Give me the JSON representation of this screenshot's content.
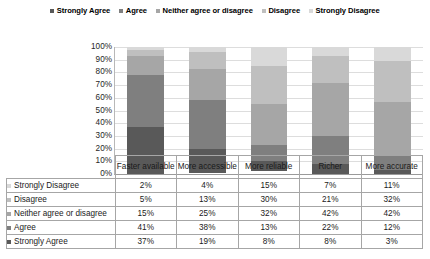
{
  "chart_data": {
    "type": "bar",
    "stacked": true,
    "orientation": "vertical",
    "normalized_percent": true,
    "title": "",
    "xlabel": "",
    "ylabel": "",
    "ylim": [
      0,
      100
    ],
    "grid": true,
    "legend_position": "top-center",
    "categories": [
      "Faster available",
      "More accessible",
      "More reliable",
      "Richer",
      "More accurate"
    ],
    "tick_labels": [
      "100%",
      "90%",
      "80%",
      "70%",
      "60%",
      "50%",
      "40%",
      "30%",
      "20%",
      "10%",
      "0%"
    ],
    "tick_values": [
      100,
      90,
      80,
      70,
      60,
      50,
      40,
      30,
      20,
      10,
      0
    ],
    "stack_order_bottom_to_top": [
      "Strongly Agree",
      "Agree",
      "Neither agree or disagree",
      "Disagree",
      "Strongly Disagree"
    ],
    "series": [
      {
        "name": "Strongly Agree",
        "color": "#595959",
        "values": [
          37,
          19,
          8,
          8,
          3
        ]
      },
      {
        "name": "Agree",
        "color": "#7f7f7f",
        "values": [
          41,
          38,
          13,
          22,
          12
        ]
      },
      {
        "name": "Neither agree or disagree",
        "color": "#a6a6a6",
        "values": [
          15,
          25,
          32,
          42,
          42
        ]
      },
      {
        "name": "Disagree",
        "color": "#bfbfbf",
        "values": [
          5,
          13,
          30,
          21,
          32
        ]
      },
      {
        "name": "Strongly Disagree",
        "color": "#d9d9d9",
        "values": [
          2,
          4,
          15,
          7,
          11
        ]
      }
    ]
  },
  "legend": {
    "items": [
      {
        "label": "Strongly Agree",
        "color": "#595959"
      },
      {
        "label": "Agree",
        "color": "#7f7f7f"
      },
      {
        "label": "Neither agree or disagree",
        "color": "#a6a6a6"
      },
      {
        "label": "Disagree",
        "color": "#bfbfbf"
      },
      {
        "label": "Strongly Disagree",
        "color": "#d9d9d9"
      }
    ]
  },
  "table": {
    "corner_label": "",
    "columns": [
      "Faster available",
      "More accessible",
      "More reliable",
      "Richer",
      "More accurate"
    ],
    "rows": [
      {
        "label": "Strongly Disagree",
        "color": "#d9d9d9",
        "values": [
          "2%",
          "4%",
          "15%",
          "7%",
          "11%"
        ]
      },
      {
        "label": "Disagree",
        "color": "#bfbfbf",
        "values": [
          "5%",
          "13%",
          "30%",
          "21%",
          "32%"
        ]
      },
      {
        "label": "Neither agree or disagree",
        "color": "#a6a6a6",
        "values": [
          "15%",
          "25%",
          "32%",
          "42%",
          "42%"
        ]
      },
      {
        "label": "Agree",
        "color": "#7f7f7f",
        "values": [
          "41%",
          "38%",
          "13%",
          "22%",
          "12%"
        ]
      },
      {
        "label": "Strongly Agree",
        "color": "#595959",
        "values": [
          "37%",
          "19%",
          "8%",
          "8%",
          "3%"
        ]
      }
    ]
  }
}
